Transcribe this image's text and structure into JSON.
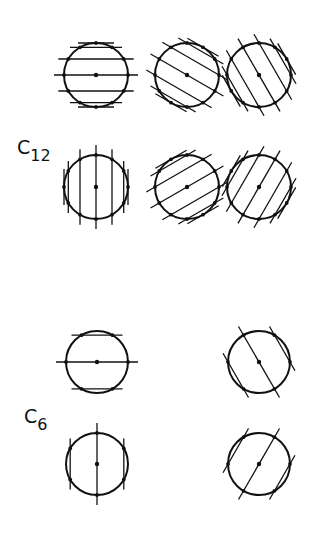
{
  "groups": [
    {
      "label": "C",
      "subscript": "12",
      "folds": 12,
      "figures": [
        {
          "row": 0,
          "col": 0,
          "line_angle_deg": 0
        },
        {
          "row": 0,
          "col": 1,
          "line_angle_deg": 30
        },
        {
          "row": 0,
          "col": 2,
          "line_angle_deg": 60
        },
        {
          "row": 1,
          "col": 0,
          "line_angle_deg": 90
        },
        {
          "row": 1,
          "col": 1,
          "line_angle_deg": -30
        },
        {
          "row": 1,
          "col": 2,
          "line_angle_deg": -60
        }
      ]
    },
    {
      "label": "C",
      "subscript": "6",
      "folds": 6,
      "figures": [
        {
          "row": 0,
          "col": 0,
          "line_angle_deg": 0
        },
        {
          "row": 0,
          "col": 2,
          "line_angle_deg": 60
        },
        {
          "row": 1,
          "col": 0,
          "line_angle_deg": 90
        },
        {
          "row": 1,
          "col": 2,
          "line_angle_deg": -60
        }
      ]
    }
  ],
  "colors": {
    "ink": "#111111",
    "background": "#ffffff"
  }
}
